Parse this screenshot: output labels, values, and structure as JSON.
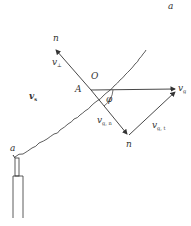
{
  "diagram": {
    "labels": {
      "a_top": "a",
      "a_bottom": "a",
      "O": "O",
      "A": "A",
      "n_top": "n",
      "n_bottom": "n",
      "phi": "φ",
      "v_perp": {
        "main": "v",
        "sub": "⊥"
      },
      "v_s": {
        "main": "v",
        "sub": "s"
      },
      "v_g": {
        "main": "v",
        "sub": "g"
      },
      "v_gn": {
        "main": "v",
        "sub": "g, n"
      },
      "v_gt": {
        "main": "v",
        "sub": "g, t"
      }
    },
    "colors": {
      "stroke": "#333333",
      "background": "#ffffff"
    }
  }
}
